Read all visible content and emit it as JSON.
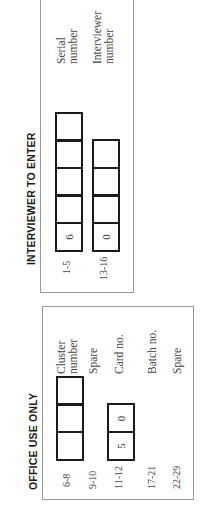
{
  "interviewer_section": {
    "heading": "INTERVIEWER TO ENTER",
    "fields": [
      {
        "columns": "1-5",
        "boxes": [
          "",
          "",
          "",
          "",
          "6"
        ],
        "label_line1": "Serial",
        "label_line2": "number"
      },
      {
        "columns": "13-16",
        "boxes": [
          "",
          "",
          "",
          "0"
        ],
        "label_line1": "Interviewer",
        "label_line2": "number"
      }
    ]
  },
  "office_section": {
    "heading": "OFFICE USE ONLY",
    "fields": [
      {
        "columns": "6-8",
        "boxes": [
          "",
          "",
          ""
        ],
        "label_line1": "Cluster",
        "label_line2": "number"
      },
      {
        "columns": "9-10",
        "boxes": [],
        "label_line1": "Spare",
        "label_line2": ""
      },
      {
        "columns": "11-12",
        "boxes": [
          "5",
          "0"
        ],
        "label_line1": "Card no.",
        "label_line2": ""
      },
      {
        "columns": "17-21",
        "boxes": [],
        "label_line1": "Batch no.",
        "label_line2": ""
      },
      {
        "columns": "22-29",
        "boxes": [],
        "label_line1": "Spare",
        "label_line2": ""
      }
    ]
  }
}
